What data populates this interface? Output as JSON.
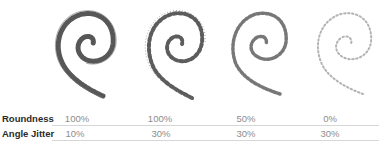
{
  "illustration": {
    "description": "Four spiral brush stroke samples demonstrating brush roundness and angle jitter",
    "samples": [
      {
        "roundness": "100%",
        "angle_jitter": "10%",
        "style": "dense-dark"
      },
      {
        "roundness": "100%",
        "angle_jitter": "30%",
        "style": "scattered-dark"
      },
      {
        "roundness": "50%",
        "angle_jitter": "30%",
        "style": "medium"
      },
      {
        "roundness": "0%",
        "angle_jitter": "30%",
        "style": "light-sparse"
      }
    ]
  },
  "table": {
    "rows": [
      {
        "label": "Roundness",
        "values": [
          "100%",
          "100%",
          "50%",
          "0%"
        ]
      },
      {
        "label": "Angle Jitter",
        "values": [
          "10%",
          "30%",
          "30%",
          "30%"
        ]
      }
    ]
  },
  "colors": {
    "label": "#2b2b2b",
    "value": "#8c8c8c",
    "rule": "#d6d6d6"
  }
}
